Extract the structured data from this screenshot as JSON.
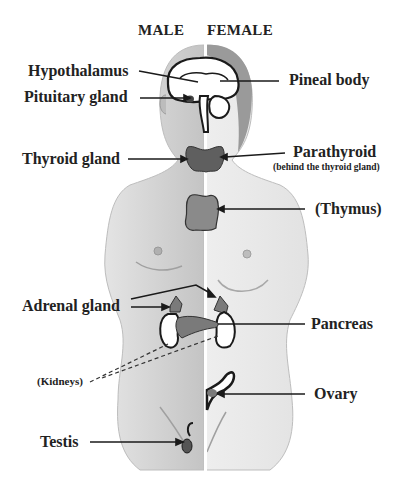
{
  "diagram": {
    "headers": {
      "male": "MALE",
      "female": "FEMALE"
    },
    "labels": {
      "hypothalamus": "Hypothalamus",
      "pituitary": "Pituitary gland",
      "pineal": "Pineal body",
      "thyroid": "Thyroid gland",
      "parathyroid": "Parathyroid",
      "parathyroid_note": "(behind the thyroid gland)",
      "thymus": "(Thymus)",
      "adrenal": "Adrenal gland",
      "pancreas": "Pancreas",
      "kidneys": "(Kidneys)",
      "ovary": "Ovary",
      "testis": "Testis"
    },
    "colors": {
      "male_body": "#c9c9c9",
      "female_body": "#e6e6e6",
      "gland": "#6e6e6e",
      "outline": "#1a1a1a",
      "text": "#222222"
    }
  }
}
